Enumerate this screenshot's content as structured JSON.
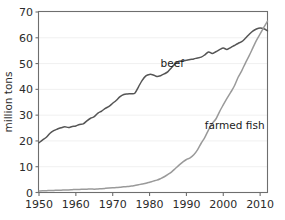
{
  "chart_data": {
    "type": "line",
    "title": "",
    "subtitle": "",
    "xlabel": "",
    "ylabel": "million tons",
    "xlim": [
      1950,
      2012
    ],
    "ylim": [
      0,
      70
    ],
    "grid": true,
    "legend_position": "inline-annotation",
    "xticks": [
      1950,
      1960,
      1970,
      1980,
      1990,
      2000,
      2010
    ],
    "xtick_labels": [
      "1950",
      "1960",
      "1970",
      "1980",
      "1990",
      "2000",
      "2010"
    ],
    "yticks": [
      0,
      10,
      20,
      30,
      40,
      50,
      60,
      70
    ],
    "ytick_labels": [
      "0",
      "10",
      "20",
      "30",
      "40",
      "50",
      "60",
      "70"
    ],
    "x": [
      1950,
      1951,
      1952,
      1953,
      1954,
      1955,
      1956,
      1957,
      1958,
      1959,
      1960,
      1961,
      1962,
      1963,
      1964,
      1965,
      1966,
      1967,
      1968,
      1969,
      1970,
      1971,
      1972,
      1973,
      1974,
      1975,
      1976,
      1977,
      1978,
      1979,
      1980,
      1981,
      1982,
      1983,
      1984,
      1985,
      1986,
      1987,
      1988,
      1989,
      1990,
      1991,
      1992,
      1993,
      1994,
      1995,
      1996,
      1997,
      1998,
      1999,
      2000,
      2001,
      2002,
      2003,
      2004,
      2005,
      2006,
      2007,
      2008,
      2009,
      2010,
      2011,
      2012
    ],
    "series": [
      {
        "name": "beef",
        "color": "#555555",
        "label": "beef",
        "label_x": 1983,
        "label_y": 48.5,
        "values": [
          19.3,
          20.4,
          21.4,
          23.0,
          24.0,
          24.6,
          25.1,
          25.5,
          25.2,
          25.6,
          25.8,
          26.4,
          26.6,
          27.8,
          28.8,
          29.4,
          30.8,
          31.6,
          32.6,
          33.4,
          34.6,
          35.8,
          37.2,
          38.0,
          38.2,
          38.3,
          38.5,
          41.0,
          43.5,
          45.2,
          45.8,
          45.6,
          45.0,
          45.3,
          46.0,
          46.9,
          48.5,
          50.0,
          50.9,
          51.0,
          51.3,
          51.6,
          51.8,
          52.2,
          52.5,
          53.4,
          54.5,
          53.9,
          54.6,
          55.4,
          56.0,
          55.5,
          56.2,
          57.0,
          57.8,
          58.5,
          59.8,
          61.3,
          62.6,
          63.4,
          63.8,
          63.5,
          62.7
        ]
      },
      {
        "name": "farmed fish",
        "color": "#9a9a9a",
        "label": "farmed fish",
        "label_x": 1995,
        "label_y": 24.5,
        "values": [
          0.6,
          0.7,
          0.7,
          0.8,
          0.8,
          0.9,
          0.9,
          1.0,
          1.0,
          1.1,
          1.2,
          1.2,
          1.3,
          1.3,
          1.4,
          1.3,
          1.4,
          1.5,
          1.6,
          1.7,
          1.8,
          1.9,
          2.0,
          2.2,
          2.3,
          2.5,
          2.7,
          3.0,
          3.3,
          3.6,
          4.0,
          4.4,
          4.8,
          5.4,
          6.1,
          7.0,
          8.0,
          9.3,
          10.6,
          11.8,
          12.8,
          13.4,
          14.6,
          16.5,
          19.1,
          21.4,
          24.3,
          26.8,
          28.5,
          31.4,
          34.0,
          36.5,
          38.8,
          41.3,
          44.6,
          47.2,
          50.2,
          53.0,
          56.0,
          59.0,
          61.5,
          64.0,
          66.5
        ]
      }
    ]
  },
  "axis": {
    "y_title": "million tons"
  }
}
